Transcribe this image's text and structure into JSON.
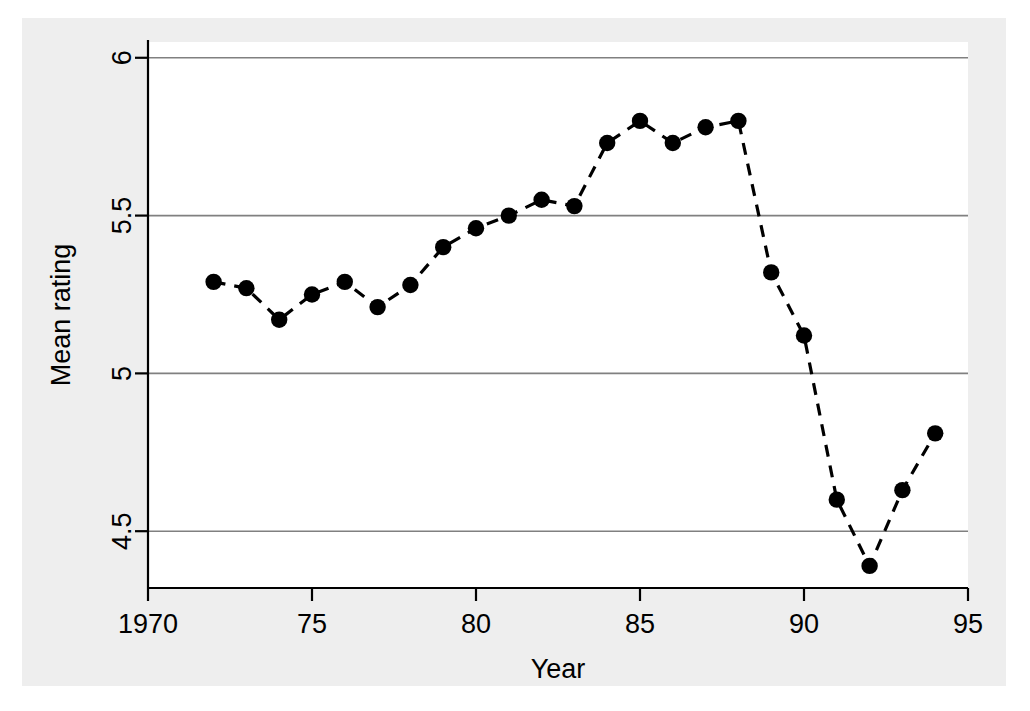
{
  "chart_data": {
    "type": "line",
    "title": "",
    "subtitle": "",
    "xlabel": "Year",
    "ylabel": "Mean rating",
    "xlim": [
      1970,
      1995
    ],
    "ylim": [
      4.32,
      6.05
    ],
    "xticks": [
      1970,
      1975,
      1980,
      1985,
      1990,
      1995
    ],
    "xticklabels": [
      "1970",
      "75",
      "80",
      "85",
      "90",
      "95"
    ],
    "yticks": [
      4.5,
      5,
      5.5,
      6
    ],
    "yticklabels": [
      "4.5",
      "5",
      "5.5",
      "6"
    ],
    "grid": "horizontal",
    "legend": "none",
    "marker": "filled-circle",
    "linestyle": "dashed",
    "series_color": "#000000",
    "background_color": "#eeeeee",
    "plot_background_color": "#ffffff",
    "gridline_color": "#808080",
    "x": [
      1972,
      1973,
      1974,
      1975,
      1976,
      1977,
      1978,
      1979,
      1980,
      1981,
      1982,
      1983,
      1984,
      1985,
      1986,
      1987,
      1988,
      1989,
      1990,
      1991,
      1992,
      1993,
      1994
    ],
    "values": [
      5.29,
      5.27,
      5.17,
      5.25,
      5.29,
      5.21,
      5.28,
      5.4,
      5.46,
      5.5,
      5.55,
      5.53,
      5.73,
      5.8,
      5.73,
      5.78,
      5.8,
      5.32,
      5.12,
      4.6,
      4.39,
      4.63,
      4.81
    ],
    "series": [
      {
        "name": "Mean rating",
        "values": [
          5.29,
          5.27,
          5.17,
          5.25,
          5.29,
          5.21,
          5.28,
          5.4,
          5.46,
          5.5,
          5.55,
          5.53,
          5.73,
          5.8,
          5.73,
          5.78,
          5.8,
          5.32,
          5.12,
          4.6,
          4.39,
          4.63,
          4.81
        ]
      }
    ]
  }
}
